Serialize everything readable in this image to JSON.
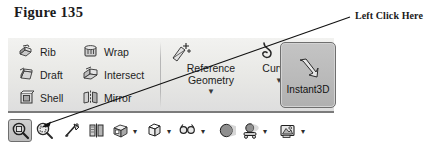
{
  "figure": {
    "title": "Figure 135"
  },
  "callout": {
    "label": "Left Click Here",
    "target": "zoom-to-fit-button",
    "arrow_from": [
      350,
      17
    ],
    "arrow_to": [
      41,
      127
    ]
  },
  "ribbon": {
    "columns": [
      {
        "name": "features-column-1",
        "items": [
          {
            "label": "Rib",
            "icon": "rib-icon"
          },
          {
            "label": "Draft",
            "icon": "draft-icon"
          },
          {
            "label": "Shell",
            "icon": "shell-icon"
          }
        ]
      },
      {
        "name": "features-column-2",
        "items": [
          {
            "label": "Wrap",
            "icon": "wrap-icon"
          },
          {
            "label": "Intersect",
            "icon": "intersect-icon"
          },
          {
            "label": "Mirror",
            "icon": "mirror-icon"
          }
        ]
      }
    ],
    "dropdown_buttons": [
      {
        "label_line1": "Reference",
        "label_line2": "Geometry",
        "icon": "reference-geometry-icon",
        "caret": "▼"
      },
      {
        "label_line1": "Curves",
        "label_line2": "",
        "icon": "curves-icon",
        "caret": "▼"
      }
    ],
    "toggle_button": {
      "label": "Instant3D",
      "icon": "instant3d-icon",
      "state": "pressed"
    }
  },
  "view_toolbar": {
    "items": [
      {
        "name": "zoom-to-fit-button",
        "icon": "magnifier-fit-icon",
        "caret": "",
        "state": "pressed"
      },
      {
        "name": "zoom-to-area-button",
        "icon": "magnifier-area-icon",
        "caret": "",
        "state": "normal"
      },
      {
        "name": "previous-view-button",
        "icon": "previous-view-icon",
        "caret": "",
        "state": "normal"
      },
      {
        "name": "section-view-button",
        "icon": "section-view-icon",
        "caret": "",
        "state": "normal"
      },
      {
        "name": "view-orientation-button",
        "icon": "view-orientation-icon",
        "caret": "▾",
        "state": "normal"
      },
      {
        "name": "display-style-button",
        "icon": "display-style-icon",
        "caret": "▾",
        "state": "normal"
      },
      {
        "name": "hide-show-items-button",
        "icon": "hide-show-items-icon",
        "caret": "▾",
        "state": "normal"
      },
      {
        "name": "edit-appearance-button",
        "icon": "appearance-sphere-icon",
        "caret": "",
        "state": "normal"
      },
      {
        "name": "apply-scene-button",
        "icon": "apply-scene-icon",
        "caret": "▾",
        "state": "normal"
      },
      {
        "name": "view-settings-button",
        "icon": "view-settings-icon",
        "caret": "▾",
        "state": "normal"
      }
    ]
  },
  "colors": {
    "ribbon_bg": "#e9e9e6",
    "pressed_button": "#bdbdbd",
    "text": "#1d1d1d",
    "line": "#111111"
  }
}
